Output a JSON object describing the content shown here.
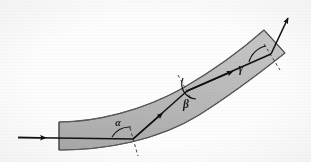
{
  "figure": {
    "kind": "optics-ray-diagram",
    "background_color": "#fdfdfd",
    "slab": {
      "name": "curved-waveguide-slab",
      "fill_color": "#b3b3b3",
      "fill_color_light": "#c2c2c2",
      "outline_color": "#4a4a4a",
      "outline_width": 1.1,
      "description": "Gray curved band arcing from lower-left to upper-right"
    },
    "ray": {
      "name": "light-ray-path",
      "stroke_color": "#111111",
      "stroke_width": 1.6,
      "incoming_label": "",
      "outgoing_label": ""
    },
    "normals": {
      "name": "surface-normal-dashes",
      "stroke_color": "#333333",
      "dash_pattern": "3 2.5",
      "stroke_width": 1
    },
    "angles": [
      {
        "id": "alpha",
        "symbol": "α",
        "x": 118,
        "y": 125,
        "font_size": 10
      },
      {
        "id": "beta",
        "symbol": "β",
        "x": 186,
        "y": 108,
        "font_size": 11
      },
      {
        "id": "gamma",
        "symbol": "γ",
        "x": 241,
        "y": 72,
        "font_size": 11
      }
    ],
    "reflection_points": [
      {
        "id": "p1",
        "x": 133,
        "y": 139,
        "wall": "bottom"
      },
      {
        "id": "p2",
        "x": 187,
        "y": 91,
        "wall": "top"
      },
      {
        "id": "p3",
        "x": 271,
        "y": 54,
        "wall": "bottom"
      }
    ],
    "entry_arrow": {
      "from_x": 18,
      "from_y": 137,
      "to_x": 133,
      "to_y": 139
    },
    "exit_arrow": {
      "from_x": 271,
      "from_y": 54,
      "to_x": 289,
      "to_y": 16
    }
  }
}
